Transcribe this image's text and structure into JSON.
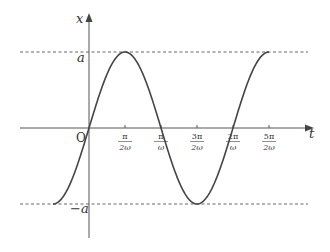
{
  "chart_data": {
    "type": "line",
    "title": "",
    "function": "x = a sin(ωt)",
    "xlabel": "t",
    "ylabel": "x",
    "origin_label": "O",
    "y_ticks": [
      {
        "label": "a",
        "value": 1
      },
      {
        "label": "−a",
        "value": -1
      }
    ],
    "x_ticks": [
      {
        "num": "π",
        "den": "2ω",
        "value": 0.5
      },
      {
        "num": "π",
        "den": "ω",
        "value": 1.0
      },
      {
        "num": "3π",
        "den": "2ω",
        "value": 1.5
      },
      {
        "num": "2π",
        "den": "ω",
        "value": 2.0
      },
      {
        "num": "5π",
        "den": "2ω",
        "value": 2.5
      }
    ],
    "x_unit": "π/ω",
    "x_range": [
      -0.5,
      2.5
    ],
    "ylim": [
      -1,
      1
    ],
    "reference_lines": [
      {
        "y": 1,
        "style": "dashed"
      },
      {
        "y": -1,
        "style": "dashed"
      }
    ],
    "series": [
      {
        "name": "x(t)",
        "x": [
          -0.5,
          -0.25,
          0,
          0.25,
          0.5,
          0.75,
          1.0,
          1.25,
          1.5,
          1.75,
          2.0,
          2.25,
          2.5
        ],
        "values": [
          -1,
          -0.707,
          0,
          0.707,
          1,
          0.707,
          0,
          -0.707,
          -1,
          -0.707,
          0,
          0.707,
          1
        ]
      }
    ],
    "grid": false,
    "legend": null
  },
  "colors": {
    "curve": "#444444",
    "axes": "#555555",
    "dashed": "#555555",
    "text": "#333333"
  }
}
